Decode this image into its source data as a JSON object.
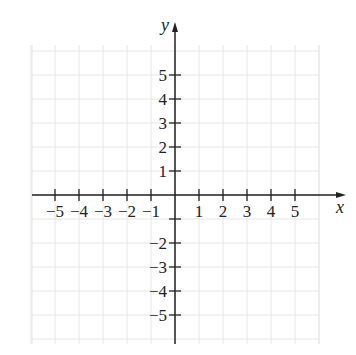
{
  "chart_data": {
    "type": "scatter",
    "title": "",
    "xlabel": "x",
    "ylabel": "y",
    "xlim": [
      -6,
      6
    ],
    "ylim": [
      -6,
      6
    ],
    "grid": true,
    "x_ticks": [
      -5,
      -4,
      -3,
      -2,
      -1,
      1,
      2,
      3,
      4,
      5
    ],
    "y_ticks": [
      5,
      4,
      3,
      2,
      1,
      -2,
      -3,
      -4,
      -5
    ],
    "x_tick_labels": [
      "−5",
      "−4",
      "−3",
      "−2",
      "−1",
      "1",
      "2",
      "3",
      "4",
      "5"
    ],
    "y_tick_labels": [
      "5",
      "4",
      "3",
      "2",
      "1",
      "−2",
      "−3",
      "−4",
      "−5"
    ],
    "series": [],
    "colors": {
      "axis": "#222222",
      "grid": "#e6e6e6"
    }
  }
}
